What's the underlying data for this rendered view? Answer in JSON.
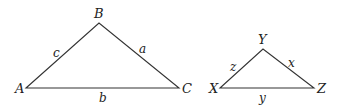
{
  "colors": {
    "stroke": "#333333",
    "text": "#222222",
    "background": "#ffffff"
  },
  "triangles": [
    {
      "name": "ABC",
      "vertices": [
        {
          "label": "A",
          "x": 26,
          "y": 88
        },
        {
          "label": "B",
          "x": 99,
          "y": 23
        },
        {
          "label": "C",
          "x": 179,
          "y": 88
        }
      ],
      "sides": [
        {
          "label": "c",
          "between": "A-B"
        },
        {
          "label": "a",
          "between": "B-C"
        },
        {
          "label": "b",
          "between": "A-C"
        }
      ]
    },
    {
      "name": "XYZ",
      "vertices": [
        {
          "label": "X",
          "x": 220,
          "y": 88
        },
        {
          "label": "Y",
          "x": 263,
          "y": 49
        },
        {
          "label": "Z",
          "x": 314,
          "y": 88
        }
      ],
      "sides": [
        {
          "label": "z",
          "between": "X-Y"
        },
        {
          "label": "x",
          "between": "Y-Z"
        },
        {
          "label": "y",
          "between": "X-Z"
        }
      ]
    }
  ]
}
